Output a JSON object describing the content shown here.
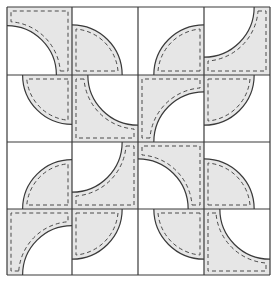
{
  "diagram": {
    "colors": {
      "background": "#ffffff",
      "fabric_fill": "#e6e6e6",
      "outline": "#3a3a3a",
      "seam_dash": "#4a4a4a"
    },
    "grid": {
      "rows": 4,
      "cols": 4,
      "x_lines": [
        7,
        72,
        138,
        204,
        270
      ],
      "y_lines": [
        7,
        75,
        142,
        209,
        275
      ],
      "arc_radius_ratio": 0.76,
      "seam_inset": 4
    },
    "cells": [
      {
        "row": 0,
        "col": 0,
        "piece": "white-quarter",
        "corner": "bl"
      },
      {
        "row": 0,
        "col": 1,
        "piece": "gray-quarter",
        "corner": "bl"
      },
      {
        "row": 0,
        "col": 2,
        "piece": "gray-quarter",
        "corner": "br"
      },
      {
        "row": 0,
        "col": 3,
        "piece": "white-quarter",
        "corner": "tl"
      },
      {
        "row": 1,
        "col": 0,
        "piece": "gray-quarter",
        "corner": "tr"
      },
      {
        "row": 1,
        "col": 1,
        "piece": "white-quarter",
        "corner": "tr"
      },
      {
        "row": 1,
        "col": 2,
        "piece": "white-quarter",
        "corner": "br"
      },
      {
        "row": 1,
        "col": 3,
        "piece": "gray-quarter",
        "corner": "tl"
      },
      {
        "row": 2,
        "col": 0,
        "piece": "gray-quarter",
        "corner": "br"
      },
      {
        "row": 2,
        "col": 1,
        "piece": "white-quarter",
        "corner": "tl"
      },
      {
        "row": 2,
        "col": 2,
        "piece": "white-quarter",
        "corner": "bl"
      },
      {
        "row": 2,
        "col": 3,
        "piece": "gray-quarter",
        "corner": "bl"
      },
      {
        "row": 3,
        "col": 0,
        "piece": "white-quarter",
        "corner": "br"
      },
      {
        "row": 3,
        "col": 1,
        "piece": "gray-quarter",
        "corner": "tl"
      },
      {
        "row": 3,
        "col": 2,
        "piece": "gray-quarter",
        "corner": "tr"
      },
      {
        "row": 3,
        "col": 3,
        "piece": "white-quarter",
        "corner": "tr"
      }
    ]
  }
}
